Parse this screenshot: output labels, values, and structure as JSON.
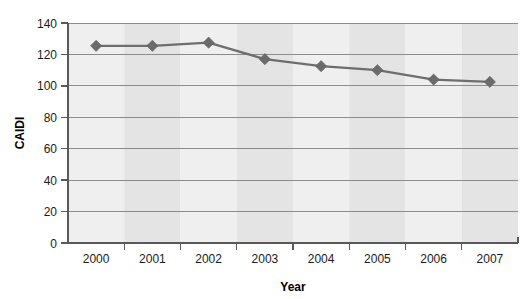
{
  "chart_data": {
    "type": "line",
    "title": "",
    "xlabel": "Year",
    "ylabel": "CAIDI",
    "categories": [
      "2000",
      "2001",
      "2002",
      "2003",
      "2004",
      "2005",
      "2006",
      "2007"
    ],
    "values": [
      125.5,
      125.5,
      127.5,
      117,
      112.5,
      110,
      104,
      102.5
    ],
    "series": [
      {
        "name": "CAIDI",
        "values": [
          125.5,
          125.5,
          127.5,
          117,
          112.5,
          110,
          104,
          102.5
        ]
      }
    ],
    "ylim": [
      0,
      140
    ],
    "ytick_labels": [
      "0",
      "20",
      "40",
      "60",
      "80",
      "100",
      "120",
      "140"
    ],
    "ytick_values": [
      0,
      20,
      40,
      60,
      80,
      100,
      120,
      140
    ],
    "grid": "horizontal",
    "legend": "none",
    "marker": "diamond",
    "colors": {
      "line": "#6e6e6e",
      "marker": "#6b6b6b",
      "gridline": "#8c8c8c",
      "axis": "#595959",
      "band_light": "#efefef",
      "band_dark": "#e4e4e4",
      "text": "#1a1a1a",
      "background": "#ffffff"
    }
  },
  "axes": {
    "y": {
      "label": "CAIDI",
      "ticks": [
        "0",
        "20",
        "40",
        "60",
        "80",
        "100",
        "120",
        "140"
      ]
    },
    "x": {
      "label": "Year",
      "ticks": [
        "2000",
        "2001",
        "2002",
        "2003",
        "2004",
        "2005",
        "2006",
        "2007"
      ]
    }
  }
}
